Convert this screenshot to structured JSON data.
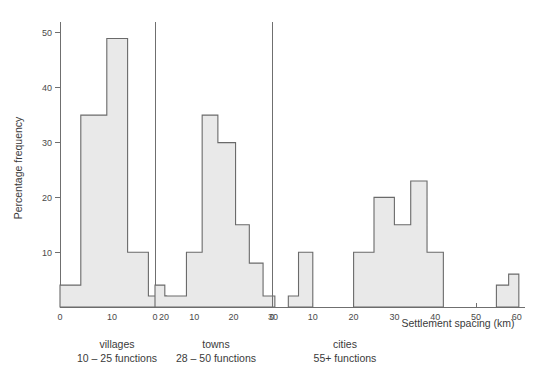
{
  "figure": {
    "ylabel": "Percentage frequency",
    "xlabel": "Settlement spacing (km)",
    "y_ticks": [
      "10",
      "20",
      "30",
      "40",
      "50"
    ],
    "y_tick_values": [
      10,
      20,
      30,
      40,
      50
    ],
    "ylim": [
      0,
      52
    ],
    "bar_fill_color": "#e9e9e9",
    "bar_edge_color": "#6a6a6a",
    "axis_color": "#6f6f6f",
    "background_color": "#ffffff"
  },
  "panels": [
    {
      "id": "villages",
      "caption_line1": "villages",
      "caption_line2": "10 – 25 functions",
      "x_ticks": [
        "0",
        "10",
        "20"
      ],
      "x_tick_values": [
        0,
        10,
        20
      ],
      "xlim": [
        0,
        21
      ]
    },
    {
      "id": "towns",
      "caption_line1": "towns",
      "caption_line2": "28 – 50 functions",
      "x_ticks": [
        "0",
        "10",
        "20",
        "30"
      ],
      "x_tick_values": [
        0,
        10,
        20,
        30
      ],
      "xlim": [
        0,
        31
      ]
    },
    {
      "id": "cities",
      "caption_line1": "cities",
      "caption_line2": "55+ functions",
      "x_ticks": [
        "0",
        "10",
        "20",
        "30",
        "40",
        "50",
        "60"
      ],
      "x_tick_values": [
        0,
        10,
        20,
        30,
        40,
        50,
        60
      ],
      "xlim": [
        0,
        62
      ]
    }
  ],
  "chart_data": {
    "type": "bar",
    "title": "",
    "xlabel": "Settlement spacing (km)",
    "ylabel": "Percentage frequency",
    "ylim": [
      0,
      52
    ],
    "grid": false,
    "legend": "none",
    "note": "Three side-by-side histograms of settlement spacing (km) versus percentage frequency for villages, towns and cities.",
    "subplots": [
      {
        "name": "villages",
        "caption": "villages 10 – 25 functions",
        "xlabel": "",
        "ylabel": "Percentage frequency",
        "xlim": [
          0,
          21
        ],
        "ylim": [
          0,
          52
        ],
        "x_ticks": [
          0,
          10,
          20
        ],
        "bins": [
          {
            "start": 0,
            "end": 4,
            "value": 4
          },
          {
            "start": 4,
            "end": 9,
            "value": 35
          },
          {
            "start": 9,
            "end": 13,
            "value": 49
          },
          {
            "start": 13,
            "end": 17,
            "value": 10
          },
          {
            "start": 17,
            "end": 20.5,
            "value": 2
          }
        ]
      },
      {
        "name": "towns",
        "caption": "towns 28 – 50 functions",
        "xlabel": "",
        "ylabel": "",
        "xlim": [
          0,
          31
        ],
        "ylim": [
          0,
          52
        ],
        "x_ticks": [
          0,
          10,
          20,
          30
        ],
        "bins": [
          {
            "start": 0,
            "end": 2.5,
            "value": 4
          },
          {
            "start": 2.5,
            "end": 8,
            "value": 2
          },
          {
            "start": 8,
            "end": 12,
            "value": 10
          },
          {
            "start": 12,
            "end": 16,
            "value": 35
          },
          {
            "start": 16,
            "end": 20.5,
            "value": 30
          },
          {
            "start": 20.5,
            "end": 24,
            "value": 15
          },
          {
            "start": 24,
            "end": 27.5,
            "value": 8
          },
          {
            "start": 27.5,
            "end": 30.5,
            "value": 2
          }
        ]
      },
      {
        "name": "cities",
        "caption": "cities 55+ functions",
        "xlabel": "Settlement spacing (km)",
        "ylabel": "",
        "xlim": [
          0,
          62
        ],
        "ylim": [
          0,
          52
        ],
        "x_ticks": [
          0,
          10,
          20,
          30,
          40,
          50,
          60
        ],
        "bins": [
          {
            "start": 4,
            "end": 6.5,
            "value": 2
          },
          {
            "start": 6.5,
            "end": 10,
            "value": 10
          },
          {
            "start": 20,
            "end": 25,
            "value": 10
          },
          {
            "start": 25,
            "end": 30,
            "value": 20
          },
          {
            "start": 30,
            "end": 34,
            "value": 15
          },
          {
            "start": 34,
            "end": 38,
            "value": 23
          },
          {
            "start": 38,
            "end": 42,
            "value": 10
          },
          {
            "start": 55,
            "end": 58,
            "value": 4
          },
          {
            "start": 58,
            "end": 60.5,
            "value": 6
          }
        ]
      }
    ]
  }
}
